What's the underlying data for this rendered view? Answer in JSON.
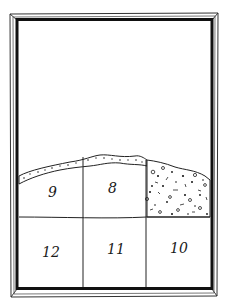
{
  "diagram": {
    "type": "excavation-section-drawing",
    "frame": {
      "outer_color": "#222222",
      "inner_color": "#111111"
    },
    "cells": [
      {
        "id": "cell-9",
        "label": "9",
        "row": "upper",
        "fill": "plain"
      },
      {
        "id": "cell-8",
        "label": "8",
        "row": "upper",
        "fill": "plain"
      },
      {
        "id": "cell-rubble",
        "label": "",
        "row": "upper",
        "fill": "speckled"
      },
      {
        "id": "cell-12",
        "label": "12",
        "row": "lower",
        "fill": "plain"
      },
      {
        "id": "cell-11",
        "label": "11",
        "row": "lower",
        "fill": "plain"
      },
      {
        "id": "cell-10",
        "label": "10",
        "row": "lower",
        "fill": "plain"
      }
    ],
    "labels": {
      "c9": "9",
      "c8": "8",
      "c12": "12",
      "c11": "11",
      "c10": "10"
    }
  }
}
